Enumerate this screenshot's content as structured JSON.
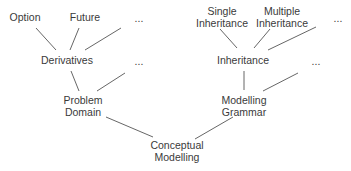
{
  "diagram": {
    "type": "tree",
    "root": "Conceptual Modelling",
    "nodes": {
      "option": {
        "lines": [
          "Option"
        ],
        "x": 25,
        "y": 11
      },
      "future": {
        "lines": [
          "Future"
        ],
        "x": 85,
        "y": 11
      },
      "etc1": {
        "lines": [
          "..."
        ],
        "x": 139,
        "y": 12
      },
      "derivatives": {
        "lines": [
          "Derivatives"
        ],
        "x": 67,
        "y": 54
      },
      "etc2": {
        "lines": [
          "..."
        ],
        "x": 139,
        "y": 55
      },
      "problem_domain": {
        "lines": [
          "Problem",
          "Domain"
        ],
        "x": 83,
        "y": 94
      },
      "single_inheritance": {
        "lines": [
          "Single",
          "Inheritance"
        ],
        "x": 222,
        "y": 5
      },
      "multiple_inheritance": {
        "lines": [
          "Multiple",
          "Inheritance"
        ],
        "x": 282,
        "y": 5
      },
      "etc3": {
        "lines": [
          "..."
        ],
        "x": 338,
        "y": 12
      },
      "inheritance": {
        "lines": [
          "Inheritance"
        ],
        "x": 243,
        "y": 54
      },
      "etc4": {
        "lines": [
          "..."
        ],
        "x": 316,
        "y": 55
      },
      "modelling_grammar": {
        "lines": [
          "Modelling",
          "Grammar"
        ],
        "x": 244,
        "y": 94
      },
      "conceptual_modelling": {
        "lines": [
          "Conceptual",
          "Modelling"
        ],
        "x": 177,
        "y": 139
      }
    },
    "edges": [
      {
        "from": "option",
        "to": "derivatives",
        "x1": 36,
        "y1": 28,
        "x2": 56,
        "y2": 50
      },
      {
        "from": "future",
        "to": "derivatives",
        "x1": 79,
        "y1": 28,
        "x2": 70,
        "y2": 50
      },
      {
        "from": "etc1",
        "to": "derivatives",
        "x1": 121,
        "y1": 28,
        "x2": 85,
        "y2": 50
      },
      {
        "from": "derivatives",
        "to": "problem_domain",
        "x1": 71,
        "y1": 71,
        "x2": 79,
        "y2": 91
      },
      {
        "from": "etc2",
        "to": "problem_domain",
        "x1": 125,
        "y1": 73,
        "x2": 97,
        "y2": 91
      },
      {
        "from": "single_inheritance",
        "to": "inheritance",
        "x1": 220,
        "y1": 29,
        "x2": 237,
        "y2": 48
      },
      {
        "from": "multiple_inheritance",
        "to": "inheritance",
        "x1": 270,
        "y1": 29,
        "x2": 254,
        "y2": 48
      },
      {
        "from": "etc3",
        "to": "inheritance",
        "x1": 316,
        "y1": 27,
        "x2": 268,
        "y2": 50
      },
      {
        "from": "inheritance",
        "to": "modelling_grammar",
        "x1": 244,
        "y1": 71,
        "x2": 244,
        "y2": 90
      },
      {
        "from": "etc4",
        "to": "modelling_grammar",
        "x1": 298,
        "y1": 73,
        "x2": 263,
        "y2": 91
      },
      {
        "from": "problem_domain",
        "to": "conceptual_modelling",
        "x1": 106,
        "y1": 117,
        "x2": 153,
        "y2": 137
      },
      {
        "from": "modelling_grammar",
        "to": "conceptual_modelling",
        "x1": 233,
        "y1": 117,
        "x2": 195,
        "y2": 139
      }
    ]
  }
}
